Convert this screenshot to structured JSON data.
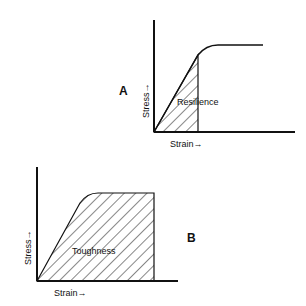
{
  "diagrams": [
    {
      "id": "A",
      "panel_label": "A",
      "region_label": "Resilience",
      "x_axis_label": "Strain→",
      "y_axis_label": "Stress→",
      "description": "Stress-strain curve; shaded area under the elastic (linear) portion represents resilience"
    },
    {
      "id": "B",
      "panel_label": "B",
      "region_label": "Toughness",
      "x_axis_label": "Strain→",
      "y_axis_label": "Stress→",
      "description": "Stress-strain curve; shaded area under the whole curve up to fracture represents toughness"
    }
  ],
  "colors": {
    "ink": "#111111",
    "background": "#ffffff"
  }
}
